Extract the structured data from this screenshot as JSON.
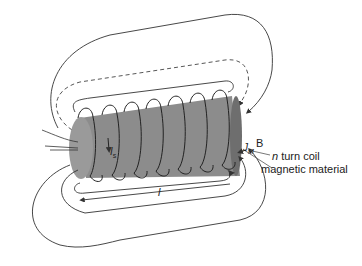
{
  "diagram": {
    "labels": {
      "B": "B",
      "J_M": "J",
      "J_M_sub": "M",
      "n": "n",
      "coil": " turn coil",
      "material": "magnetic material",
      "I_s": "I",
      "I_s_sub": "s",
      "length": "l"
    },
    "colors": {
      "core": "#8c8c8c",
      "core_dark": "#6e6e6e",
      "lines": "#333333",
      "dashed": "#444444",
      "label_text": "#222222"
    }
  }
}
